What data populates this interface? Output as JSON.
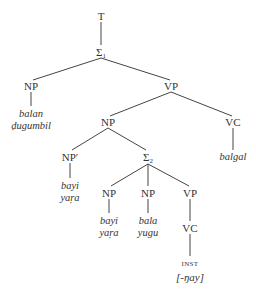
{
  "tree": {
    "root": {
      "label": "T"
    },
    "s1": {
      "label": "Σ",
      "sub": "1"
    },
    "np_subject": {
      "label": "NP",
      "words": [
        "balan",
        "ḍugumbil"
      ]
    },
    "vp_main": {
      "label": "VP"
    },
    "np_object": {
      "label": "NP"
    },
    "vc_main": {
      "label": "VC",
      "words": [
        "balgal"
      ]
    },
    "np_prime": {
      "label": "NP′",
      "words": [
        "bayi",
        "yaṛa"
      ]
    },
    "s2": {
      "label": "Σ",
      "sub": "2"
    },
    "np_s2_a": {
      "label": "NP",
      "words": [
        "bayi",
        "yaṛa"
      ]
    },
    "np_s2_b": {
      "label": "NP",
      "words": [
        "bala",
        "yugu"
      ]
    },
    "vp_s2": {
      "label": "VP"
    },
    "vc_s2": {
      "label": "VC",
      "feature": "INST",
      "morpheme": "[-ŋay]"
    }
  }
}
